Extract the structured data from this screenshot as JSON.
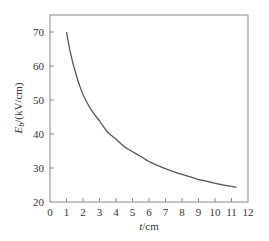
{
  "chart_data": {
    "type": "line",
    "title": "",
    "xlabel": "t/cm",
    "xlabel_italic": "t",
    "xlabel_unit": "/cm",
    "ylabel": "E_b/(kV/cm)",
    "ylabel_main": "E",
    "ylabel_sub": "b",
    "ylabel_unit": "/(kV/cm)",
    "xlim": [
      0,
      12
    ],
    "ylim": [
      20,
      75
    ],
    "xticks": [
      0,
      1,
      2,
      3,
      4,
      5,
      6,
      7,
      8,
      9,
      10,
      11,
      12
    ],
    "yticks": [
      20,
      30,
      40,
      50,
      60,
      70
    ],
    "grid": false,
    "legend": null,
    "series": [
      {
        "name": "E_b vs t",
        "color": "#555555",
        "x": [
          1.0,
          1.5,
          2.0,
          2.5,
          3.0,
          3.5,
          4.0,
          4.5,
          5.0,
          5.5,
          6.0,
          6.5,
          7.0,
          7.5,
          8.0,
          8.5,
          9.0,
          9.5,
          10.0,
          10.5,
          11.0,
          11.3
        ],
        "y": [
          70.0,
          58.9,
          51.6,
          47.1,
          43.9,
          40.5,
          38.5,
          36.3,
          34.8,
          33.4,
          31.9,
          30.8,
          29.8,
          28.9,
          28.1,
          27.4,
          26.6,
          26.1,
          25.5,
          25.0,
          24.6,
          24.3
        ]
      }
    ]
  }
}
